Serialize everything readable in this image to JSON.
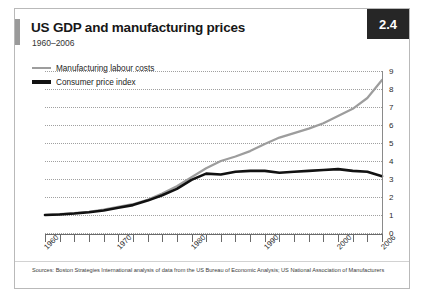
{
  "figure": {
    "badge": "2.4",
    "title": "US GDP and manufacturing prices",
    "subtitle": "1960–2006",
    "source": "Sources: Boston Strategies International analysis of data from the US Bureau of Economic Analysis; US National Association of Manufacturers"
  },
  "colors": {
    "series_gray": "#9d9d9d",
    "series_black": "#111111",
    "badge_bg": "#262626",
    "gridline": "#a0a0a0"
  },
  "chart_data": {
    "type": "line",
    "title": "US GDP and manufacturing prices",
    "subtitle": "1960–2006",
    "xlabel": "",
    "ylabel": "",
    "xlim": [
      1960,
      2006
    ],
    "ylim": [
      0,
      9
    ],
    "grid": true,
    "legend_position": "top-left",
    "y_ticks": [
      0,
      1,
      2,
      3,
      4,
      5,
      6,
      7,
      8,
      9
    ],
    "y_tick_labels": [
      "0",
      "1",
      "2",
      "3",
      "4",
      "5",
      "6",
      "7",
      "8",
      "9"
    ],
    "x_tick_labels": [
      "1960",
      "1970",
      "1980",
      "1990",
      "2000",
      "2006"
    ],
    "x_tick_label_values": [
      1960,
      1970,
      1980,
      1990,
      2000,
      2006
    ],
    "x_minor_tick_interval": 2,
    "x": [
      1960,
      1962,
      1964,
      1966,
      1968,
      1970,
      1972,
      1974,
      1976,
      1978,
      1980,
      1982,
      1984,
      1986,
      1988,
      1990,
      1992,
      1994,
      1996,
      1998,
      2000,
      2002,
      2004,
      2006
    ],
    "series": [
      {
        "name": "Manufacturing labour costs",
        "color": "#9d9d9d",
        "values": [
          1.0,
          1.05,
          1.1,
          1.18,
          1.3,
          1.45,
          1.6,
          1.85,
          2.2,
          2.6,
          3.1,
          3.6,
          4.0,
          4.25,
          4.55,
          4.95,
          5.3,
          5.55,
          5.8,
          6.1,
          6.5,
          6.9,
          7.5,
          8.5
        ]
      },
      {
        "name": "Consumer price index",
        "color": "#111111",
        "values": [
          1.0,
          1.03,
          1.08,
          1.15,
          1.25,
          1.4,
          1.55,
          1.8,
          2.1,
          2.45,
          2.95,
          3.3,
          3.25,
          3.4,
          3.45,
          3.45,
          3.35,
          3.4,
          3.45,
          3.5,
          3.55,
          3.45,
          3.4,
          3.15
        ]
      }
    ]
  }
}
